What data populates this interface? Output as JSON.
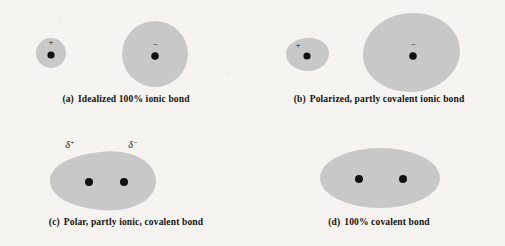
{
  "figure": {
    "background_color": "#f6f4f0",
    "cloud_fill_color": "#c8c8c8",
    "nucleus_color": "#111111",
    "text_color": "#14120f"
  },
  "panels": [
    {
      "key": "a",
      "label": "(a)",
      "caption": "Idealized 100% ionic bond",
      "caption_full": "(a)  Idealized 100% ionic bond",
      "shape_description": "two separate perfect circles",
      "atoms": [
        {
          "name": "cation",
          "charge_symbol": "+",
          "shape": "circle",
          "relative_size": "small"
        },
        {
          "name": "anion",
          "charge_symbol": "−",
          "shape": "circle",
          "relative_size": "large"
        }
      ]
    },
    {
      "key": "b",
      "label": "(b)",
      "caption": "Polarized, partly covalent ionic bond",
      "caption_full": "(b)  Polarized, partly covalent ionic bond",
      "shape_description": "two separate distorted egg-shaped clouds",
      "atoms": [
        {
          "name": "cation",
          "charge_symbol": "+",
          "shape": "distorted-egg",
          "relative_size": "small"
        },
        {
          "name": "anion",
          "charge_symbol": "−",
          "shape": "distorted-egg",
          "relative_size": "large"
        }
      ]
    },
    {
      "key": "c",
      "label": "(c)",
      "caption": "Polar, partly ionic, covalent bond",
      "caption_full": "(c)  Polar, partly ionic, covalent bond",
      "shape_description": "single merged asymmetric ellipse with two nuclei",
      "atoms": [
        {
          "name": "partial-positive-atom",
          "charge_symbol": "δ⁺",
          "shape": "merged",
          "relative_size": "small"
        },
        {
          "name": "partial-negative-atom",
          "charge_symbol": "δ⁻",
          "shape": "merged",
          "relative_size": "large"
        }
      ]
    },
    {
      "key": "d",
      "label": "(d)",
      "caption": "100% covalent bond",
      "caption_full": "(d)  100% covalent bond",
      "shape_description": "single symmetric ellipse with two evenly spaced nuclei",
      "atoms": [
        {
          "name": "atom-left",
          "charge_symbol": "",
          "shape": "merged",
          "relative_size": "equal"
        },
        {
          "name": "atom-right",
          "charge_symbol": "",
          "shape": "merged",
          "relative_size": "equal"
        }
      ]
    }
  ]
}
